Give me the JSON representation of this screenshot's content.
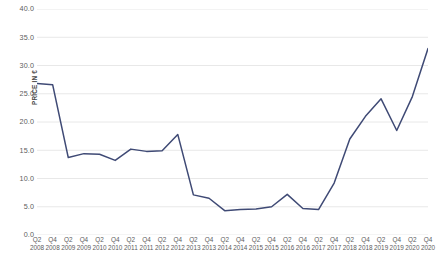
{
  "chart_data": {
    "type": "line",
    "title": "",
    "xlabel": "",
    "ylabel": "PRICE IN €",
    "ylim": [
      0.0,
      40.0
    ],
    "ytick_step": 5.0,
    "ytick_labels": [
      "40.0",
      "35.0",
      "30.0",
      "25.0",
      "20.0",
      "15.0",
      "10.0",
      "5.0",
      "0.0"
    ],
    "ytick_values": [
      40.0,
      35.0,
      30.0,
      25.0,
      20.0,
      15.0,
      10.0,
      5.0,
      0.0
    ],
    "grid": true,
    "grid_axis": "y",
    "legend": false,
    "legend_position": "none",
    "line_color": "#3F4A75",
    "grid_color": "#E8E8E8",
    "background_color": "#FFFFFF",
    "categories": [
      "Q2 2008",
      "Q4 2008",
      "Q2 2009",
      "Q4 2009",
      "Q2 2010",
      "Q4 2010",
      "Q2 2011",
      "Q4 2011",
      "Q2 2012",
      "Q4 2012",
      "Q2 2013",
      "Q4 2013",
      "Q2 2014",
      "Q4 2014",
      "Q2 2015",
      "Q4 2015",
      "Q2 2016",
      "Q4 2016",
      "Q2 2017",
      "Q4 2017",
      "Q2 2018",
      "Q4 2018",
      "Q2 2019",
      "Q4 2019",
      "Q2 2020",
      "Q4 2020"
    ],
    "quarter_labels": [
      "Q2",
      "Q4",
      "Q2",
      "Q4",
      "Q2",
      "Q4",
      "Q2",
      "Q4",
      "Q2",
      "Q4",
      "Q2",
      "Q4",
      "Q2",
      "Q4",
      "Q2",
      "Q4",
      "Q2",
      "Q4",
      "Q2",
      "Q4",
      "Q2",
      "Q4",
      "Q2",
      "Q4",
      "Q2",
      "Q4"
    ],
    "year_labels": [
      "2008",
      "2008",
      "2009",
      "2009",
      "2010",
      "2010",
      "2011",
      "2011",
      "2012",
      "2012",
      "2013",
      "2013",
      "2014",
      "2014",
      "2015",
      "2015",
      "2016",
      "2016",
      "2017",
      "2017",
      "2018",
      "2018",
      "2019",
      "2019",
      "2020",
      "2020"
    ],
    "values": [
      26.8,
      26.6,
      13.7,
      14.4,
      14.3,
      13.2,
      15.2,
      14.8,
      14.9,
      17.8,
      7.1,
      6.5,
      4.3,
      4.5,
      4.6,
      5.0,
      7.2,
      4.7,
      4.5,
      9.2,
      17.0,
      21.0,
      24.1,
      18.5,
      24.5,
      33.0
    ],
    "series_name": "Price"
  }
}
